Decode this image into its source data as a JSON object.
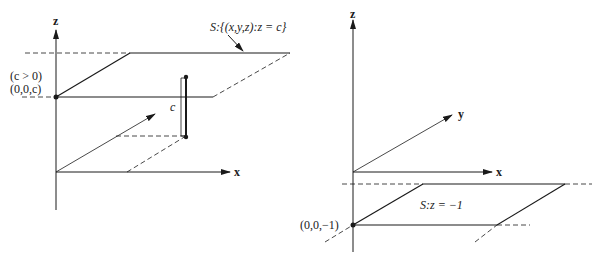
{
  "left_figure": {
    "axes": {
      "z_label": "z",
      "x_label": "x"
    },
    "plane_label": "S:{(x,y,z):z = c}",
    "condition_label": "(c > 0)",
    "point_label": "(0,0,c)",
    "height_label": "c"
  },
  "right_figure": {
    "axes": {
      "z_label": "z",
      "x_label": "x",
      "y_label": "y"
    },
    "plane_label": "S:z = −1",
    "point_label": "(0,0,−1)"
  },
  "colors": {
    "ink": "#1a1a1a",
    "background": "#ffffff"
  }
}
